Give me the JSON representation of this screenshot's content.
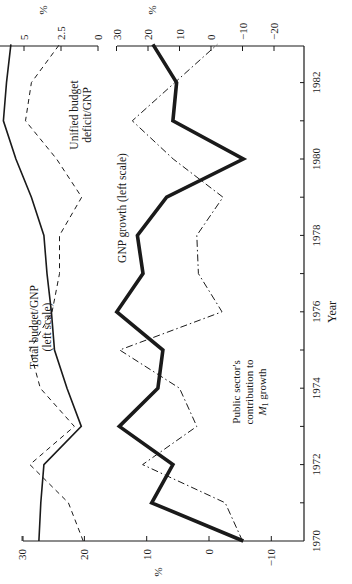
{
  "chart_data": {
    "type": "line",
    "orientation": "rotated-90-ccw",
    "title": "",
    "xlabel": "Year",
    "x": [
      1970,
      1971,
      1972,
      1973,
      1974,
      1975,
      1976,
      1977,
      1978,
      1979,
      1980,
      1981,
      1982,
      1983
    ],
    "x_ticks": [
      "1970",
      "1972",
      "1974",
      "1976",
      "1978",
      "1980",
      "1982"
    ],
    "axes": {
      "left": {
        "label": "%",
        "ticks": [
          30,
          20,
          10,
          0,
          -10
        ],
        "range": [
          -15,
          30
        ]
      },
      "right_outer": {
        "label": "%",
        "ticks": [
          5,
          2.5,
          0
        ],
        "range": [
          0,
          6.6
        ]
      },
      "right_inner": {
        "label": "%",
        "ticks": [
          30,
          20,
          10,
          0,
          -10,
          -20
        ],
        "range": [
          -20,
          30
        ]
      }
    },
    "series": [
      {
        "name": "Total budget/GNP (left scale)",
        "axis": "left",
        "style": "solid-thin",
        "values": [
          27.3,
          27.0,
          26.5,
          20.5,
          22.8,
          24.8,
          25.3,
          26.0,
          26.5,
          28.5,
          31.0,
          33.0,
          32.5,
          31.8
        ]
      },
      {
        "name": "Unified budget deficit/GNP",
        "axis": "right_outer",
        "style": "dashed",
        "values": [
          1.0,
          2.0,
          4.6,
          1.6,
          3.9,
          4.6,
          3.1,
          2.6,
          2.6,
          1.1,
          2.8,
          4.9,
          4.5,
          2.6
        ]
      },
      {
        "name": "GNP growth (left scale)",
        "axis": "left",
        "style": "solid-thick",
        "values": [
          -5.5,
          9.2,
          5.8,
          14.4,
          8.2,
          7.4,
          14.8,
          10.6,
          11.5,
          6.8,
          -5.5,
          5.8,
          5.2,
          9.0
        ]
      },
      {
        "name": "Public sector's contribution to M1 growth",
        "axis": "right_inner",
        "style": "dash-dot",
        "values": [
          -10.0,
          -4.5,
          21.7,
          4.5,
          10.0,
          29.0,
          -3.5,
          4.0,
          4.5,
          -3.8,
          12.0,
          25.0,
          11.5,
          -2.0
        ]
      }
    ],
    "annotations": [
      "Total budget/GNP",
      "(left scale)",
      "Unified budget",
      "deficit/GNP",
      "GNP growth (left scale)",
      "Public sector's",
      "contribution to",
      "M1 growth"
    ]
  },
  "labels": {
    "xlabel": "Year",
    "left_unit": "%",
    "right_outer_unit": "%",
    "right_inner_unit": "%",
    "total_budget_1": "Total budget/GNP",
    "total_budget_2": "(left scale)",
    "deficit_1": "Unified budget",
    "deficit_2": "deficit/GNP",
    "gnp_growth": "GNP growth (left scale)",
    "m1_1": "Public sector's",
    "m1_2": "contribution to",
    "m1_3_a": "M",
    "m1_3_sub": "1",
    "m1_3_b": " growth"
  }
}
